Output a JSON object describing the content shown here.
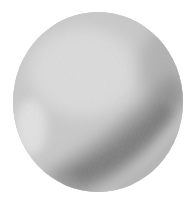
{
  "image": {
    "subject": "watercolor grayscale sphere",
    "description": "Gray painted circle with a dark diagonal band across the lower right and lighter highlight at upper left"
  },
  "colors": {
    "background": "#ffffff",
    "base": "#c9c9c9",
    "highlight": "#dcdcdc",
    "light_edge": "#e2e2e2",
    "shadow_band": "#8e8e8e",
    "shadow_deep": "#7a7a7a",
    "rim": "#b0b0b0"
  }
}
